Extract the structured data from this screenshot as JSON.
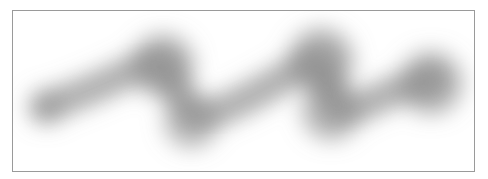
{
  "page": {
    "background_color": "#ffffff",
    "width": 488,
    "height": 179
  },
  "figure": {
    "name": "blurred-scribble-figure",
    "frame": {
      "x": 12,
      "y": 10,
      "width": 463,
      "height": 162,
      "border_color": "#9a9a9a",
      "border_width": 1,
      "background_color": "#ffffff"
    },
    "artwork": {
      "type": "blurred-gray-zigzag-stroke",
      "ink_color": "#8c8c8c",
      "darkest_value": "#8f8f8f",
      "lightest_value": "#ffffff",
      "blur_radius": 13,
      "stroke_width": 30,
      "path_points": [
        {
          "x": 33,
          "y": 96
        },
        {
          "x": 95,
          "y": 72
        },
        {
          "x": 148,
          "y": 45
        },
        {
          "x": 165,
          "y": 82
        },
        {
          "x": 185,
          "y": 110
        },
        {
          "x": 250,
          "y": 80
        },
        {
          "x": 305,
          "y": 45
        },
        {
          "x": 318,
          "y": 80
        },
        {
          "x": 330,
          "y": 104
        },
        {
          "x": 380,
          "y": 80
        },
        {
          "x": 418,
          "y": 68
        }
      ],
      "blobs": [
        {
          "name": "blob-left-end",
          "cx": 33,
          "cy": 96,
          "r": 17,
          "opacity": 0.55
        },
        {
          "name": "blob-first-peak",
          "cx": 150,
          "cy": 55,
          "r": 31,
          "opacity": 0.72
        },
        {
          "name": "blob-first-valley",
          "cx": 178,
          "cy": 110,
          "r": 27,
          "opacity": 0.62
        },
        {
          "name": "blob-second-peak",
          "cx": 308,
          "cy": 50,
          "r": 32,
          "opacity": 0.74
        },
        {
          "name": "blob-second-valley",
          "cx": 318,
          "cy": 100,
          "r": 29,
          "opacity": 0.66
        },
        {
          "name": "blob-right-end",
          "cx": 418,
          "cy": 72,
          "r": 31,
          "opacity": 0.7
        }
      ]
    }
  }
}
